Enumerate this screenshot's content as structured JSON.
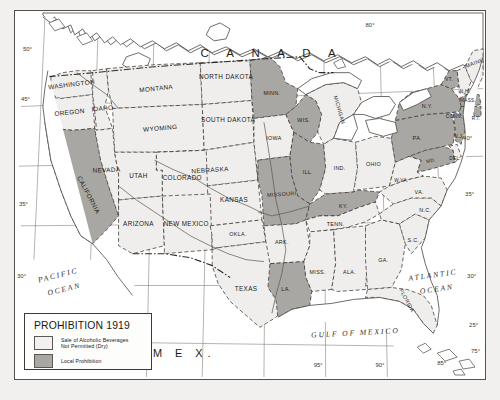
{
  "map": {
    "title": "Prohibition 1919",
    "country_labels": [
      {
        "name": "canada",
        "text": "C A N A D A"
      },
      {
        "name": "mexico",
        "text": "M E X."
      }
    ],
    "ocean_labels": [
      {
        "name": "pacific-ocean",
        "line1": "PACIFIC",
        "line2": "OCEAN"
      },
      {
        "name": "atlantic-ocean",
        "line1": "ATLANTIC",
        "line2": "OCEAN"
      },
      {
        "name": "gulf-of-mexico",
        "line1": "GULF OF MEXICO"
      }
    ],
    "graticule_labels": {
      "left": [
        "50°",
        "45°",
        "35°",
        "30°"
      ],
      "right": [
        "40°",
        "35°",
        "30°",
        "25°",
        "75°"
      ],
      "top": [
        "80°"
      ],
      "bottom": [
        "115°",
        "95°",
        "90°",
        "85°"
      ]
    },
    "states": [
      {
        "name": "washington",
        "label": "WASHINGTON",
        "status": "dry"
      },
      {
        "name": "oregon",
        "label": "OREGON",
        "status": "dry"
      },
      {
        "name": "idaho",
        "label": "IDAHO",
        "status": "dry"
      },
      {
        "name": "montana",
        "label": "MONTANA",
        "status": "dry"
      },
      {
        "name": "wyoming",
        "label": "WYOMING",
        "status": "dry"
      },
      {
        "name": "north-dakota",
        "label": "NORTH DAKOTA",
        "status": "dry"
      },
      {
        "name": "south-dakota",
        "label": "SOUTH DAKOTA",
        "status": "dry"
      },
      {
        "name": "nebraska",
        "label": "NEBRASKA",
        "status": "dry"
      },
      {
        "name": "california",
        "label": "CALIFORNIA",
        "status": "local"
      },
      {
        "name": "nevada",
        "label": "NEVADA",
        "status": "dry"
      },
      {
        "name": "utah",
        "label": "UTAH",
        "status": "dry"
      },
      {
        "name": "colorado",
        "label": "COLORADO",
        "status": "dry"
      },
      {
        "name": "kansas",
        "label": "KANSAS",
        "status": "dry"
      },
      {
        "name": "arizona",
        "label": "ARIZONA",
        "status": "dry"
      },
      {
        "name": "new-mexico",
        "label": "NEW MEXICO",
        "status": "dry"
      },
      {
        "name": "oklahoma",
        "label": "OKLA.",
        "status": "dry"
      },
      {
        "name": "texas",
        "label": "TEXAS",
        "status": "dry"
      },
      {
        "name": "minnesota",
        "label": "MINN.",
        "status": "local"
      },
      {
        "name": "iowa",
        "label": "IOWA",
        "status": "dry"
      },
      {
        "name": "wisconsin",
        "label": "WIS.",
        "status": "local"
      },
      {
        "name": "michigan",
        "label": "MICHIGAN",
        "status": "dry"
      },
      {
        "name": "illinois",
        "label": "ILL.",
        "status": "local"
      },
      {
        "name": "indiana",
        "label": "IND.",
        "status": "dry"
      },
      {
        "name": "ohio",
        "label": "OHIO",
        "status": "dry"
      },
      {
        "name": "missouri",
        "label": "MISSOURI",
        "status": "local"
      },
      {
        "name": "kentucky",
        "label": "KY.",
        "status": "local"
      },
      {
        "name": "arkansas",
        "label": "ARK.",
        "status": "dry"
      },
      {
        "name": "tennessee",
        "label": "TENN.",
        "status": "dry"
      },
      {
        "name": "mississippi",
        "label": "MISS.",
        "status": "dry"
      },
      {
        "name": "alabama",
        "label": "ALA.",
        "status": "dry"
      },
      {
        "name": "louisiana",
        "label": "LA.",
        "status": "local"
      },
      {
        "name": "georgia",
        "label": "GA.",
        "status": "dry"
      },
      {
        "name": "florida",
        "label": "FLORIDA",
        "status": "dry"
      },
      {
        "name": "south-carolina",
        "label": "S.C.",
        "status": "dry"
      },
      {
        "name": "north-carolina",
        "label": "N.C.",
        "status": "dry"
      },
      {
        "name": "virginia",
        "label": "VA.",
        "status": "dry"
      },
      {
        "name": "west-virginia",
        "label": "W.VA.",
        "status": "dry"
      },
      {
        "name": "maryland",
        "label": "MD.",
        "status": "local"
      },
      {
        "name": "delaware",
        "label": "DEL.",
        "status": "dry"
      },
      {
        "name": "pennsylvania",
        "label": "PA.",
        "status": "local"
      },
      {
        "name": "new-jersey",
        "label": "N.J.",
        "status": "local"
      },
      {
        "name": "new-york",
        "label": "N.Y.",
        "status": "local"
      },
      {
        "name": "connecticut",
        "label": "CONN.",
        "status": "local"
      },
      {
        "name": "rhode-island",
        "label": "R.I.",
        "status": "local"
      },
      {
        "name": "massachusetts",
        "label": "MASS.",
        "status": "local"
      },
      {
        "name": "vermont",
        "label": "VT.",
        "status": "local"
      },
      {
        "name": "new-hampshire",
        "label": "N.H.",
        "status": "dry"
      },
      {
        "name": "maine",
        "label": "MAINE",
        "status": "dry"
      }
    ]
  },
  "legend": {
    "title": "PROHIBITION 1919",
    "entries": [
      {
        "name": "dry",
        "swatch_color": "#f2f1ef",
        "text": "Sale of Alcoholic Beverages\nNot Permitted (Dry)"
      },
      {
        "name": "local",
        "swatch_color": "#a9a7a3",
        "text": "Local Prohibition"
      }
    ]
  },
  "colors": {
    "dry_fill": "#efeeec",
    "local_fill": "#a9a7a3",
    "ink": "#3a3632",
    "paper": "#f1f0ee"
  }
}
